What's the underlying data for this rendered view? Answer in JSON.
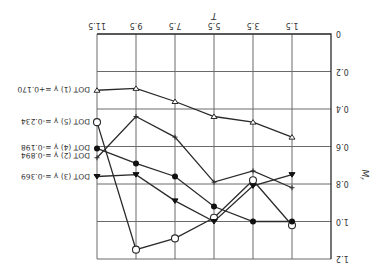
{
  "chart_data": {
    "type": "line",
    "title": "",
    "orientation_note_visible": "figure rendered rotated 180 degrees",
    "xlabel": "T",
    "ylabel": "M_r",
    "x_ticks": [
      "0",
      "1.5",
      "3.5",
      "5.5",
      "7.5",
      "9.5",
      "11.5"
    ],
    "y_ticks": [
      "0",
      "0.2",
      "0.4",
      "0.6",
      "0.8",
      "1.0",
      "1.2"
    ],
    "ylim": [
      0,
      1.2
    ],
    "grid": true,
    "x": [
      1.5,
      3.5,
      5.5,
      7.5,
      9.5,
      11.5
    ],
    "series": [
      {
        "name": "DOT (1)",
        "label": "DOT (1)  γ =+0.170",
        "marker": "open-triangle",
        "values": [
          0.55,
          0.47,
          0.44,
          0.36,
          0.29,
          0.3
        ],
        "end_marker": "open-circle-small"
      },
      {
        "name": "DOT (5)",
        "label": "DOT (5)  γ =-0.234",
        "marker": "open-circle",
        "values": [
          1.02,
          0.78,
          0.98,
          1.09,
          1.15,
          0.47
        ]
      },
      {
        "name": "DOT (4)",
        "label": "DOT (4)  γ =-0.198",
        "marker": "filled-circle",
        "values": [
          1.0,
          1.0,
          0.92,
          0.76,
          0.69,
          0.61
        ]
      },
      {
        "name": "DOT (2)",
        "label": "DOT (2)  γ =-0.894",
        "marker": "plus",
        "values": [
          0.82,
          0.73,
          0.79,
          0.55,
          0.44,
          0.66
        ]
      },
      {
        "name": "DOT (3)",
        "label": "DOT (3)  γ =-0.369",
        "marker": "filled-triangle",
        "values": [
          0.75,
          0.81,
          1.0,
          0.89,
          0.75,
          0.76
        ]
      }
    ],
    "legend_position": "right, beside line ends at T=11.5"
  }
}
